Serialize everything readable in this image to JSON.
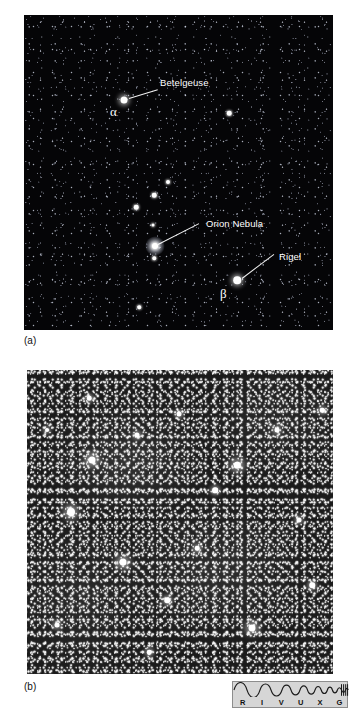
{
  "figure": {
    "panel_a": {
      "caption": "(a)",
      "annotations": [
        {
          "label": "Betelgeuse",
          "greek": "α",
          "name": "betelgeuse"
        },
        {
          "label": "Orion Nebula",
          "greek": "",
          "name": "orion-nebula"
        },
        {
          "label": "Rigel",
          "greek": "β",
          "name": "rigel"
        }
      ]
    },
    "panel_b": {
      "caption": "(b)"
    },
    "spectrum": {
      "name": "rivuxg-spectrum-indicator",
      "labels": [
        "R",
        "I",
        "V",
        "U",
        "X",
        "G"
      ],
      "highlight": "V",
      "bar_color": "#d6d6d6",
      "wave_color": "#1a1a1a"
    }
  },
  "colors": {
    "sky_a": "#030305",
    "sky_b": "#1b1b1b",
    "star": "#ffffff",
    "text_dark": "#111111",
    "page_bg": "#ffffff"
  }
}
